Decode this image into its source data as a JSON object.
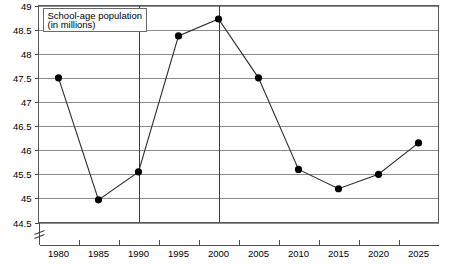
{
  "chart_data": {
    "type": "line",
    "title": "School-age population",
    "subtitle": "(in millions)",
    "title_line1": "School-age population",
    "title_line2": "(in millions)",
    "xlabel": "",
    "ylabel": "",
    "ylim": [
      44.5,
      49.0
    ],
    "xlim": [
      1977.5,
      2027.5
    ],
    "ytick_step": 0.5,
    "grid": true,
    "grid_axis": "both",
    "legend": "none",
    "axis_break": true,
    "axis_break_note": "y-axis break below 44.5",
    "categories": [
      1980,
      1985,
      1990,
      1995,
      2000,
      2005,
      2010,
      2015,
      2020,
      2025
    ],
    "x": [
      1980,
      1985,
      1990,
      1995,
      2000,
      2005,
      2010,
      2015,
      2020,
      2025
    ],
    "values": [
      47.5,
      44.97,
      45.55,
      48.37,
      48.72,
      47.5,
      45.6,
      45.2,
      45.5,
      46.15
    ],
    "series": [
      {
        "name": "School-age population",
        "values": [
          47.5,
          44.97,
          45.55,
          48.37,
          48.72,
          47.5,
          45.6,
          45.2,
          45.5,
          46.15
        ]
      }
    ],
    "ytick_labels": [
      "49",
      "48.5",
      "48",
      "47.5",
      "47",
      "46.5",
      "46",
      "45.5",
      "45",
      "44.5"
    ],
    "ytick_values": [
      49,
      48.5,
      48,
      47.5,
      47,
      46.5,
      46,
      45.5,
      45,
      44.5
    ],
    "xtick_labels": [
      "1980",
      "1985",
      "1990",
      "1995",
      "2000",
      "2005",
      "2010",
      "2015",
      "2020",
      "2025"
    ],
    "emphasized_xgridlines": [
      1990,
      2000
    ],
    "caption": ""
  },
  "colors": {
    "line": "#2b2b2b",
    "marker": "#000000",
    "grid": "#8c8c8c",
    "grid_major": "#3a3a3a",
    "axis": "#4d4d4d",
    "background": "#ffffff",
    "text": "#000000"
  }
}
